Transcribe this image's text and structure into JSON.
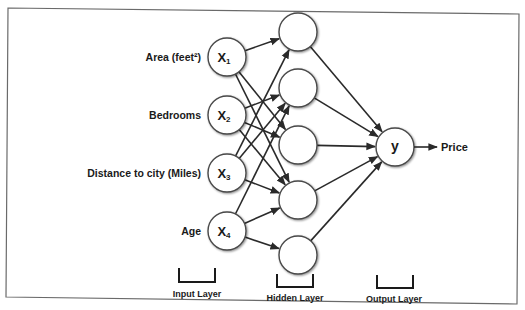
{
  "diagram": {
    "type": "neural-network",
    "colors": {
      "line": "#2a2a2a",
      "node_fill": "#ffffff",
      "node_stroke": "#4a4a4a",
      "frame": "#6a6a6a",
      "text": "#1a1a1a"
    },
    "input_layer": {
      "caption": "Input Layer",
      "nodes": [
        {
          "id": "x1",
          "symbol": "X",
          "subscript": "1",
          "label": "Area (feet²)",
          "cx": 227,
          "cy": 57
        },
        {
          "id": "x2",
          "symbol": "X",
          "subscript": "2",
          "label": "Bedrooms",
          "cx": 227,
          "cy": 115
        },
        {
          "id": "x3",
          "symbol": "X",
          "subscript": "3",
          "label": "Distance to city (Miles)",
          "cx": 227,
          "cy": 173
        },
        {
          "id": "x4",
          "symbol": "X",
          "subscript": "4",
          "label": "Age",
          "cx": 227,
          "cy": 231
        }
      ]
    },
    "hidden_layer": {
      "caption": "Hidden Layer",
      "nodes": [
        {
          "id": "h1",
          "cx": 298,
          "cy": 32
        },
        {
          "id": "h2",
          "cx": 298,
          "cy": 88
        },
        {
          "id": "h3",
          "cx": 298,
          "cy": 145
        },
        {
          "id": "h4",
          "cx": 298,
          "cy": 200
        },
        {
          "id": "h5",
          "cx": 298,
          "cy": 255
        }
      ]
    },
    "output_layer": {
      "caption": "Output Layer",
      "nodes": [
        {
          "id": "y",
          "symbol": "y",
          "label": "Price",
          "cx": 395,
          "cy": 147
        }
      ]
    },
    "edges": [
      [
        "x1",
        "h1"
      ],
      [
        "x1",
        "h3"
      ],
      [
        "x1",
        "h4"
      ],
      [
        "x2",
        "h2"
      ],
      [
        "x2",
        "h3"
      ],
      [
        "x2",
        "h4"
      ],
      [
        "x3",
        "h1"
      ],
      [
        "x3",
        "h2"
      ],
      [
        "x3",
        "h4"
      ],
      [
        "x4",
        "h2"
      ],
      [
        "x4",
        "h4"
      ],
      [
        "x4",
        "h5"
      ],
      [
        "h1",
        "y"
      ],
      [
        "h2",
        "y"
      ],
      [
        "h3",
        "y"
      ],
      [
        "h4",
        "y"
      ],
      [
        "h5",
        "y"
      ]
    ],
    "node_radius": 19
  }
}
